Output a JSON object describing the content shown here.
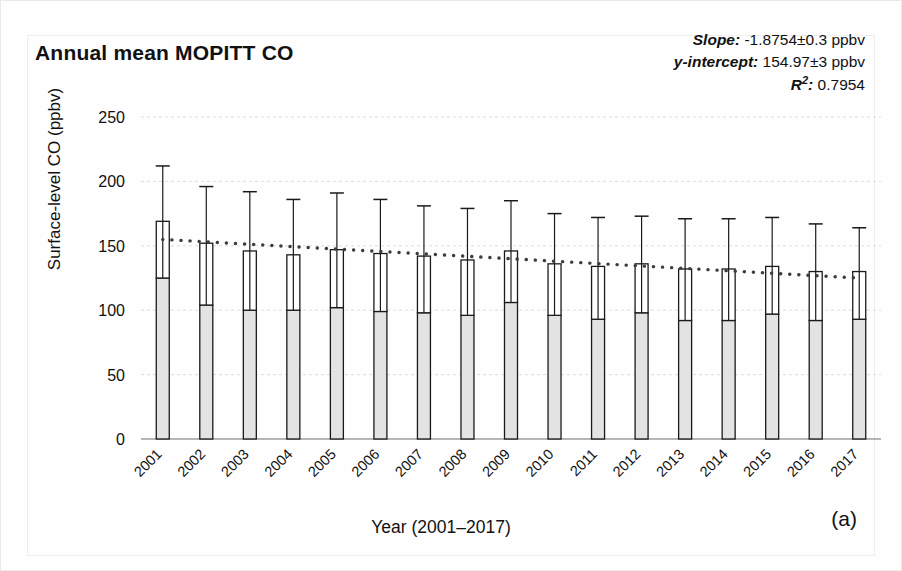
{
  "figure": {
    "title": "Annual mean MOPITT CO",
    "panel_label": "(a)",
    "xlabel": "Year (2001–2017)",
    "ylabel": "Surface-level CO (ppbv)"
  },
  "stats": {
    "slope_label": "Slope:",
    "slope_value": "-1.8754±0.3 ppbv",
    "intercept_label": "y-intercept:",
    "intercept_value": "154.97±3 ppbv",
    "r2_label": "R",
    "r2_sup": "2",
    "r2_colon": ":",
    "r2_value": "0.7954"
  },
  "colors": {
    "bar_fill": "#e3e3e3",
    "bar_upper_fill": "#ffffff",
    "bar_stroke": "#1a1a1a",
    "error_bar": "#1a1a1a",
    "trendline": "#3d3d3d",
    "gridline": "#dcdcdc",
    "axis": "#6e6e6e",
    "text": "#111111"
  },
  "chart_data": {
    "type": "bar",
    "title": "Annual mean MOPITT CO",
    "xlabel": "Year (2001–2017)",
    "ylabel": "Surface-level CO (ppbv)",
    "grid": true,
    "legend": "none",
    "ylim": [
      0,
      250
    ],
    "yticks": [
      0,
      50,
      100,
      150,
      200,
      250
    ],
    "ytick_labels": [
      "0",
      "50",
      "100",
      "150",
      "200",
      "250"
    ],
    "categories": [
      "2001",
      "2002",
      "2003",
      "2004",
      "2005",
      "2006",
      "2007",
      "2008",
      "2009",
      "2010",
      "2011",
      "2012",
      "2013",
      "2014",
      "2015",
      "2016",
      "2017"
    ],
    "values": [
      169,
      152,
      146,
      143,
      147,
      144,
      142,
      139,
      146,
      136,
      134,
      136,
      132,
      132,
      134,
      130,
      130
    ],
    "err_upper": [
      212,
      196,
      192,
      186,
      191,
      186,
      181,
      179,
      185,
      175,
      172,
      173,
      171,
      171,
      172,
      167,
      164
    ],
    "err_lower": [
      125,
      104,
      100,
      100,
      102,
      99,
      98,
      96,
      106,
      96,
      93,
      98,
      92,
      92,
      97,
      92,
      93
    ],
    "series": [
      {
        "name": "Annual mean surface-level CO (ppbv)",
        "values": [
          169,
          152,
          146,
          143,
          147,
          144,
          142,
          139,
          146,
          136,
          134,
          136,
          132,
          132,
          134,
          130,
          130
        ]
      }
    ],
    "trendline": {
      "type": "linear",
      "slope": -1.8754,
      "slope_error": 0.3,
      "intercept": 154.97,
      "intercept_error": 3,
      "r_squared": 0.7954,
      "style": "dotted",
      "x_basis": "years since 2001"
    },
    "annotations": [
      "Slope: -1.8754±0.3 ppbv",
      "y-intercept: 154.97±3 ppbv",
      "R²: 0.7954"
    ]
  }
}
